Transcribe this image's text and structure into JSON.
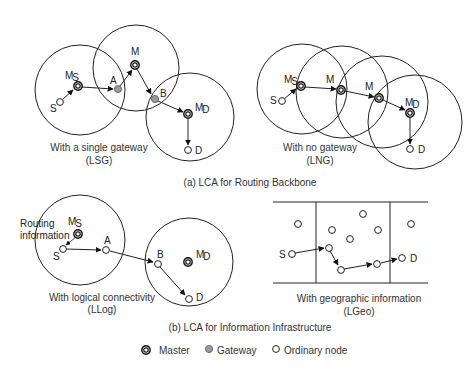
{
  "panels": {
    "lsg": {
      "caption_line1": "With a single gateway",
      "caption_line2": "(LSG)",
      "labels": {
        "ms_main": "M",
        "ms_sub": "S",
        "s": "S",
        "a": "A",
        "m": "M",
        "b": "B",
        "md_main": "M",
        "md_sub": "D",
        "d": "D"
      }
    },
    "lng": {
      "caption_line1": "With no gateway",
      "caption_line2": "(LNG)",
      "labels": {
        "ms_main": "M",
        "ms_sub": "S",
        "s": "S",
        "m1": "M",
        "m2": "M",
        "md_main": "M",
        "md_sub": "D",
        "d": "D"
      }
    },
    "llog": {
      "caption_line1": "With logical connectivity",
      "caption_line2": "(LLog)",
      "annotation_line1": "Routing",
      "annotation_line2": "information",
      "labels": {
        "ms_main": "M",
        "ms_sub": "S",
        "s": "S",
        "a": "A",
        "b": "B",
        "md_main": "M",
        "md_sub": "D",
        "d": "D"
      }
    },
    "lgeo": {
      "caption_line1": "With geographic information",
      "caption_line2": "(LGeo)",
      "labels": {
        "s": "S",
        "d": "D"
      }
    }
  },
  "section_titles": {
    "a": "(a) LCA for Routing Backbone",
    "b": "(b) LCA for Information Infrastructure"
  },
  "legend": {
    "master": "Master",
    "gateway": "Gateway",
    "ordinary": "Ordinary node"
  },
  "colors": {
    "line": "#222222",
    "gateway_fill": "#9a9a9a"
  }
}
